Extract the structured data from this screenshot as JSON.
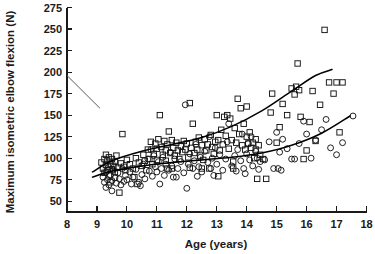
{
  "chart_data": {
    "type": "scatter",
    "title": "",
    "xlabel": "Age (years)",
    "ylabel": "Maximum isometric elbow flexion (N)",
    "xlim": [
      8,
      18
    ],
    "ylim": [
      37.5,
      275
    ],
    "grid": false,
    "legend_position": "none",
    "xticks": [
      "8",
      "9",
      "10",
      "11",
      "12",
      "13",
      "14",
      "15",
      "16",
      "17",
      "18"
    ],
    "yticks": [
      "275",
      "250",
      "225",
      "200",
      "175",
      "150",
      "125",
      "100",
      "75",
      "50"
    ],
    "annotations": [
      {
        "name": "pointer-line",
        "type": "line",
        "x1": 8.0,
        "y1": 196,
        "x2": 9.1,
        "y2": 158
      }
    ],
    "series": [
      {
        "name": "Boys",
        "marker": "square",
        "points": [
          [
            9.15,
            95
          ],
          [
            9.2,
            88
          ],
          [
            9.25,
            99
          ],
          [
            9.25,
            83
          ],
          [
            9.3,
            104
          ],
          [
            9.3,
            92
          ],
          [
            9.35,
            86
          ],
          [
            9.35,
            97
          ],
          [
            9.4,
            80
          ],
          [
            9.4,
            101
          ],
          [
            9.45,
            93
          ],
          [
            9.5,
            87
          ],
          [
            9.5,
            99
          ],
          [
            9.55,
            91
          ],
          [
            9.6,
            84
          ],
          [
            9.6,
            96
          ],
          [
            9.65,
            103
          ],
          [
            9.7,
            89
          ],
          [
            9.75,
            60
          ],
          [
            9.8,
            94
          ],
          [
            9.85,
            128
          ],
          [
            9.9,
            90
          ],
          [
            9.95,
            86
          ],
          [
            10.0,
            98
          ],
          [
            10.1,
            93
          ],
          [
            10.2,
            88
          ],
          [
            10.3,
            100
          ],
          [
            10.4,
            95
          ],
          [
            10.5,
            91
          ],
          [
            10.55,
            104
          ],
          [
            10.6,
            97
          ],
          [
            10.65,
            86
          ],
          [
            10.7,
            110
          ],
          [
            10.75,
            99
          ],
          [
            10.8,
            119
          ],
          [
            10.85,
            93
          ],
          [
            10.9,
            105
          ],
          [
            10.95,
            117
          ],
          [
            11.0,
            111
          ],
          [
            11.0,
            98
          ],
          [
            11.05,
            122
          ],
          [
            11.1,
            150
          ],
          [
            11.15,
            113
          ],
          [
            11.2,
            104
          ],
          [
            11.25,
            120
          ],
          [
            11.3,
            109
          ],
          [
            11.3,
            97
          ],
          [
            11.35,
            116
          ],
          [
            11.4,
            131
          ],
          [
            11.45,
            106
          ],
          [
            11.5,
            121
          ],
          [
            11.55,
            112
          ],
          [
            11.6,
            103
          ],
          [
            11.65,
            118
          ],
          [
            11.7,
            109
          ],
          [
            11.75,
            99
          ],
          [
            11.8,
            114
          ],
          [
            11.85,
            107
          ],
          [
            11.9,
            120
          ],
          [
            11.95,
            110
          ],
          [
            12.0,
            117
          ],
          [
            12.05,
            101
          ],
          [
            12.1,
            164
          ],
          [
            12.15,
            112
          ],
          [
            12.2,
            140
          ],
          [
            12.25,
            106
          ],
          [
            12.3,
            119
          ],
          [
            12.35,
            110
          ],
          [
            12.4,
            124
          ],
          [
            12.45,
            103
          ],
          [
            12.5,
            115
          ],
          [
            12.55,
            98
          ],
          [
            12.6,
            122
          ],
          [
            12.65,
            109
          ],
          [
            12.7,
            116
          ],
          [
            12.75,
            88
          ],
          [
            12.8,
            127
          ],
          [
            12.85,
            113
          ],
          [
            12.9,
            105
          ],
          [
            12.95,
            119
          ],
          [
            13.0,
            150
          ],
          [
            13.05,
            121
          ],
          [
            13.1,
            109
          ],
          [
            13.15,
            133
          ],
          [
            13.2,
            116
          ],
          [
            13.25,
            148
          ],
          [
            13.3,
            126
          ],
          [
            13.35,
            150
          ],
          [
            13.4,
            111
          ],
          [
            13.45,
            146
          ],
          [
            13.5,
            121
          ],
          [
            13.55,
            96
          ],
          [
            13.6,
            135
          ],
          [
            13.65,
            118
          ],
          [
            13.7,
            169
          ],
          [
            13.75,
            128
          ],
          [
            13.8,
            158
          ],
          [
            13.85,
            115
          ],
          [
            13.9,
            140
          ],
          [
            13.95,
            110
          ],
          [
            14.0,
            160
          ],
          [
            14.0,
            125
          ],
          [
            14.05,
            117
          ],
          [
            14.1,
            130
          ],
          [
            14.15,
            112
          ],
          [
            14.2,
            118
          ],
          [
            14.25,
            100
          ],
          [
            14.3,
            122
          ],
          [
            14.3,
            110
          ],
          [
            14.35,
            76
          ],
          [
            14.4,
            115
          ],
          [
            14.45,
            104
          ],
          [
            13.05,
            79
          ],
          [
            13.55,
            88
          ],
          [
            12.5,
            88
          ],
          [
            14.8,
            153
          ],
          [
            14.85,
            175
          ],
          [
            15.0,
            118
          ],
          [
            15.1,
            136
          ],
          [
            15.2,
            163
          ],
          [
            15.35,
            150
          ],
          [
            15.5,
            181
          ],
          [
            15.6,
            174
          ],
          [
            15.65,
            183
          ],
          [
            15.7,
            210
          ],
          [
            15.75,
            179
          ],
          [
            15.8,
            148
          ],
          [
            15.9,
            99
          ],
          [
            16.0,
            109
          ],
          [
            16.1,
            142
          ],
          [
            16.2,
            178
          ],
          [
            16.3,
            120
          ],
          [
            16.45,
            162
          ],
          [
            16.6,
            249
          ],
          [
            16.75,
            188
          ],
          [
            16.9,
            175
          ],
          [
            17.0,
            188
          ],
          [
            17.1,
            130
          ],
          [
            17.2,
            188
          ],
          [
            14.65,
            76
          ],
          [
            14.55,
            99
          ],
          [
            12.1,
            89
          ],
          [
            11.5,
            88
          ],
          [
            10.25,
            78
          ],
          [
            9.45,
            72
          ],
          [
            10.35,
            70
          ],
          [
            11.35,
            88
          ]
        ]
      },
      {
        "name": "Girls",
        "marker": "circle",
        "points": [
          [
            9.2,
            78
          ],
          [
            9.25,
            72
          ],
          [
            9.3,
            84
          ],
          [
            9.3,
            66
          ],
          [
            9.35,
            75
          ],
          [
            9.4,
            90
          ],
          [
            9.4,
            69
          ],
          [
            9.45,
            80
          ],
          [
            9.5,
            74
          ],
          [
            9.5,
            62
          ],
          [
            9.55,
            86
          ],
          [
            9.6,
            77
          ],
          [
            9.65,
            71
          ],
          [
            9.7,
            83
          ],
          [
            9.75,
            76
          ],
          [
            9.8,
            69
          ],
          [
            9.85,
            88
          ],
          [
            9.9,
            73
          ],
          [
            9.95,
            80
          ],
          [
            10.0,
            75
          ],
          [
            10.1,
            84
          ],
          [
            10.15,
            70
          ],
          [
            10.2,
            78
          ],
          [
            10.3,
            87
          ],
          [
            10.4,
            72
          ],
          [
            10.5,
            81
          ],
          [
            10.55,
            93
          ],
          [
            10.6,
            76
          ],
          [
            10.7,
            99
          ],
          [
            10.75,
            85
          ],
          [
            10.8,
            110
          ],
          [
            10.85,
            79
          ],
          [
            10.9,
            103
          ],
          [
            10.95,
            90
          ],
          [
            11.0,
            84
          ],
          [
            11.05,
            96
          ],
          [
            11.1,
            70
          ],
          [
            11.15,
            88
          ],
          [
            11.2,
            101
          ],
          [
            11.25,
            80
          ],
          [
            11.3,
            93
          ],
          [
            11.4,
            86
          ],
          [
            11.45,
            107
          ],
          [
            11.5,
            91
          ],
          [
            11.55,
            78
          ],
          [
            11.6,
            99
          ],
          [
            11.7,
            88
          ],
          [
            11.8,
            96
          ],
          [
            11.9,
            83
          ],
          [
            11.95,
            162
          ],
          [
            12.0,
            65
          ],
          [
            12.05,
            93
          ],
          [
            12.1,
            105
          ],
          [
            12.2,
            88
          ],
          [
            12.25,
            97
          ],
          [
            12.3,
            116
          ],
          [
            12.4,
            90
          ],
          [
            12.45,
            101
          ],
          [
            12.5,
            84
          ],
          [
            12.6,
            108
          ],
          [
            12.7,
            95
          ],
          [
            12.75,
            125
          ],
          [
            12.8,
            88
          ],
          [
            12.85,
            100
          ],
          [
            12.9,
            80
          ],
          [
            12.95,
            112
          ],
          [
            13.0,
            93
          ],
          [
            13.1,
            104
          ],
          [
            13.2,
            86
          ],
          [
            13.3,
            99
          ],
          [
            13.35,
            119
          ],
          [
            13.4,
            140
          ],
          [
            13.5,
            91
          ],
          [
            13.6,
            103
          ],
          [
            13.65,
            85
          ],
          [
            13.7,
            110
          ],
          [
            13.8,
            97
          ],
          [
            13.85,
            128
          ],
          [
            13.9,
            88
          ],
          [
            14.0,
            105
          ],
          [
            14.05,
            117
          ],
          [
            14.1,
            98
          ],
          [
            14.15,
            125
          ],
          [
            14.2,
            91
          ],
          [
            14.3,
            108
          ],
          [
            14.35,
            100
          ],
          [
            14.4,
            87
          ],
          [
            14.6,
            98
          ],
          [
            14.75,
            119
          ],
          [
            14.9,
            88
          ],
          [
            15.0,
            130
          ],
          [
            15.05,
            88
          ],
          [
            15.1,
            107
          ],
          [
            15.15,
            86
          ],
          [
            15.2,
            122
          ],
          [
            15.35,
            111
          ],
          [
            15.5,
            99
          ],
          [
            15.6,
            99
          ],
          [
            15.75,
            117
          ],
          [
            15.9,
            143
          ],
          [
            16.0,
            128
          ],
          [
            16.15,
            100
          ],
          [
            16.3,
            121
          ],
          [
            16.5,
            133
          ],
          [
            16.65,
            145
          ],
          [
            16.8,
            112
          ],
          [
            17.0,
            104
          ],
          [
            17.2,
            118
          ],
          [
            17.55,
            149
          ],
          [
            13.95,
            82
          ],
          [
            14.45,
            96
          ],
          [
            12.35,
            79
          ],
          [
            11.65,
            78
          ],
          [
            10.45,
            68
          ]
        ]
      }
    ],
    "fit_curves": [
      {
        "name": "boys-fit-curve",
        "for_series": "Boys",
        "path_points": [
          [
            8.85,
            84
          ],
          [
            9.5,
            97
          ],
          [
            10.5,
            108
          ],
          [
            11.5,
            116
          ],
          [
            12.5,
            124
          ],
          [
            13.5,
            137
          ],
          [
            14.5,
            155
          ],
          [
            15.5,
            178
          ],
          [
            16.3,
            196
          ],
          [
            16.85,
            203
          ]
        ]
      },
      {
        "name": "girls-fit-curve",
        "for_series": "Girls",
        "path_points": [
          [
            8.85,
            78
          ],
          [
            9.5,
            85
          ],
          [
            10.5,
            91
          ],
          [
            11.5,
            95
          ],
          [
            12.5,
            98
          ],
          [
            13.5,
            101
          ],
          [
            14.5,
            106
          ],
          [
            15.5,
            115
          ],
          [
            16.5,
            129
          ],
          [
            17.45,
            149
          ]
        ]
      }
    ]
  }
}
